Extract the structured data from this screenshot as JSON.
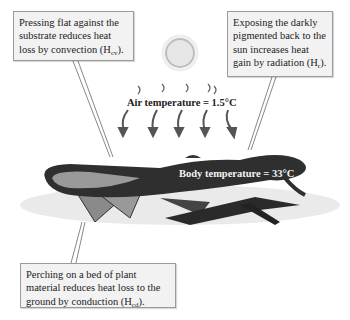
{
  "callouts": {
    "convection": {
      "text": "Pressing flat against the substrate reduces heat loss by convection (H",
      "sub": "cv",
      "tail": ")."
    },
    "radiation": {
      "text": "Exposing the darkly pigmented back to the sun increases heat gain by radiation (H",
      "sub": "r",
      "tail": ")."
    },
    "conduction": {
      "text": "Perching on a bed of plant material reduces heat loss to the ground by conduction (H",
      "sub": "cd",
      "tail": ")."
    }
  },
  "labels": {
    "air_temperature": "Air temperature = 1.5°C",
    "body_temperature": "Body temperature = 33°C"
  },
  "icons": [
    "sun-icon",
    "heat-arrow-icon",
    "lizard-illustration",
    "plant-bed-illustration"
  ],
  "colors": {
    "callout_bg": "#f2f2f2",
    "callout_border": "#9a9a9a",
    "lizard": "#2a2a2a",
    "sun": "#d8d8d8"
  }
}
